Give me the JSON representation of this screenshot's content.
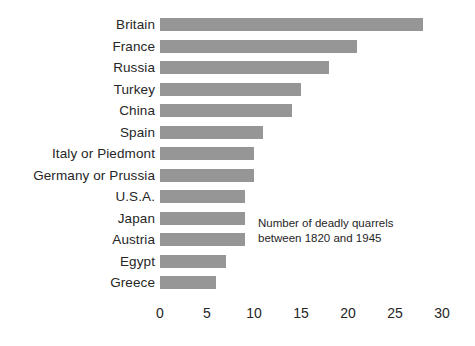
{
  "chart_data": {
    "type": "bar",
    "orientation": "horizontal",
    "title": "",
    "subtitle": "",
    "xlabel": "",
    "ylabel": "",
    "categories": [
      "Britain",
      "France",
      "Russia",
      "Turkey",
      "China",
      "Spain",
      "Italy or Piedmont",
      "Germany or Prussia",
      "U.S.A.",
      "Japan",
      "Austria",
      "Egypt",
      "Greece"
    ],
    "values": [
      28,
      21,
      18,
      15,
      14,
      11,
      10,
      10,
      9,
      9,
      9,
      7,
      6
    ],
    "xlim": [
      0,
      30
    ],
    "xticks": [
      0,
      5,
      10,
      15,
      20,
      25,
      30
    ],
    "xtick_labels": [
      "0",
      "5",
      "10",
      "15",
      "20",
      "25",
      "30"
    ],
    "grid": false,
    "legend": "none",
    "bar_color": "#969696",
    "background_color": "#ffffff",
    "text_color": "#262626",
    "annotations": [
      {
        "name": "value-note",
        "lines": [
          "Number of deadly quarrels",
          "between 1820 and 1945"
        ]
      }
    ]
  }
}
